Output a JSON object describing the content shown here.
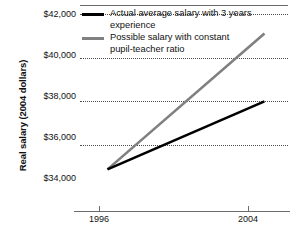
{
  "chart_data": {
    "type": "line",
    "title": "",
    "xlabel": "",
    "ylabel": "Real salary (2004 dollars)",
    "x": [
      1996,
      2004
    ],
    "xtick_labels": [
      "1996",
      "2004"
    ],
    "ytick_labels": [
      "$42,000",
      "$40,000",
      "$38,000",
      "$36,000",
      "$34,000"
    ],
    "ytick_values": [
      42000,
      40000,
      38000,
      36000,
      34000
    ],
    "ylim": [
      33000,
      42400
    ],
    "xlim": [
      1994.6,
      2005.2
    ],
    "grid": "horizontal-dotted",
    "legend_position": "top-right-inside",
    "series": [
      {
        "name": "Actual average salary with 3 years experience",
        "color": "#000000",
        "values": [
          34900,
          38000
        ]
      },
      {
        "name": "Possible salary with constant\npupil-teacher ratio",
        "color": "#808080",
        "values": [
          34900,
          41100
        ]
      }
    ]
  },
  "axes": {
    "y_title": "Real salary (2004 dollars)",
    "y_ticks": [
      {
        "label": "$42,000",
        "value": 42000
      },
      {
        "label": "$40,000",
        "value": 40000
      },
      {
        "label": "$38,000",
        "value": 38000
      },
      {
        "label": "$36,000",
        "value": 36000
      },
      {
        "label": "$34,000",
        "value": 34000
      }
    ],
    "x_ticks": [
      {
        "label": "1996",
        "value": 1996
      },
      {
        "label": "2004",
        "value": 2004
      }
    ]
  },
  "legend": {
    "items": [
      {
        "label": "Actual average salary with 3 years experience",
        "color": "#000000"
      },
      {
        "label": "Possible salary with constant\npupil-teacher ratio",
        "color": "#808080"
      }
    ]
  },
  "colors": {
    "actual_series": "#000000",
    "possible_series": "#808080",
    "gridline": "#4d4d4d",
    "axis": "#6b6b6b",
    "background": "#ffffff",
    "text": "#111111"
  }
}
